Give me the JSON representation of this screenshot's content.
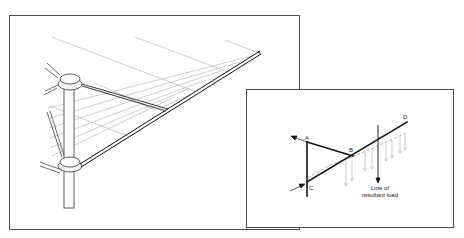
{
  "figure": {
    "main_illustration": {
      "subject": "rotary clothes line arm assembly",
      "parts": [
        "pole",
        "upper-hub",
        "lower-hub",
        "main-arm",
        "strut",
        "clothes-lines"
      ]
    },
    "inset_diagram": {
      "labels": {
        "a": "A",
        "b": "B",
        "c": "C",
        "d": "D"
      },
      "caption_line1": "Line of",
      "caption_line2": "resultant load"
    }
  },
  "colors": {
    "line": "#1a1a1a",
    "thin_line": "#9a9a9a",
    "frame": "#4a4a4a",
    "background": "#ffffff"
  }
}
